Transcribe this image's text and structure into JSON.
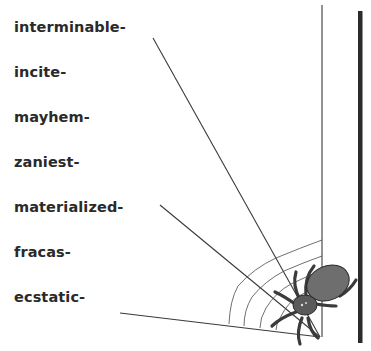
{
  "words": [
    {
      "label": "interminable-",
      "top": 20
    },
    {
      "label": "incite-",
      "top": 65
    },
    {
      "label": "mayhem-",
      "top": 110
    },
    {
      "label": "zaniest-",
      "top": 155
    },
    {
      "label": "materialized-",
      "top": 200
    },
    {
      "label": "fracas-",
      "top": 245
    },
    {
      "label": "ecstatic-",
      "top": 290
    }
  ],
  "colors": {
    "text": "#2a2a2a",
    "line": "#3a3a3a",
    "bar": "#2b2b2b",
    "spider_body": "#6e6e6e",
    "spider_outline": "#2a2a2a"
  },
  "illustration": {
    "subject": "spider-on-web",
    "rays": [
      {
        "x1": 153,
        "y1": 38,
        "x2": 320,
        "y2": 337
      },
      {
        "x1": 160,
        "y1": 205,
        "x2": 320,
        "y2": 337
      },
      {
        "x1": 120,
        "y1": 313,
        "x2": 320,
        "y2": 337
      },
      {
        "x1": 322,
        "y1": 5,
        "x2": 322,
        "y2": 337
      }
    ]
  }
}
